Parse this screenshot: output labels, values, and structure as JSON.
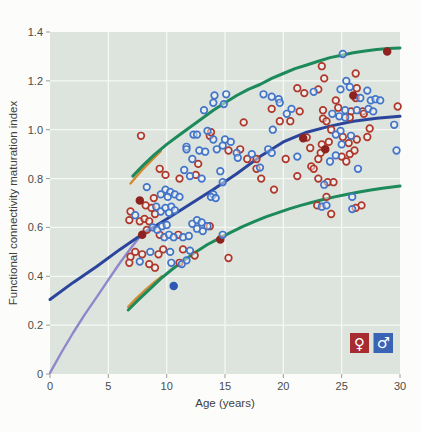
{
  "figure": {
    "xlabel": "Age (years)",
    "ylabel": "Functional connectivity maturation index",
    "legend": {
      "female_symbol": "♀",
      "male_symbol": "♂",
      "female_color": "#a82b31",
      "male_color": "#3a62b5"
    }
  },
  "chart_data": {
    "type": "scatter",
    "title": "",
    "xlabel": "Age (years)",
    "ylabel": "Functional connectivity maturation index",
    "xlim": [
      0,
      30
    ],
    "ylim": [
      0,
      1.4
    ],
    "xticks": [
      "0",
      "5",
      "10",
      "15",
      "20",
      "25",
      "30"
    ],
    "xtick_values": [
      0,
      5,
      10,
      15,
      20,
      25,
      30
    ],
    "yticks": [
      "0",
      "0.2",
      "0.4",
      "0.6",
      "0.8",
      "1.0",
      "1.2",
      "1.4"
    ],
    "ytick_values": [
      0,
      0.2,
      0.4,
      0.6,
      0.8,
      1.0,
      1.2,
      1.4
    ],
    "grid": true,
    "plot_bg": "#dde4de",
    "grid_color": "#f4f7f4",
    "legend_position": "bottom-right-inside",
    "series": [
      {
        "name": "female",
        "legend_symbol": "♀",
        "marker": "open-circle",
        "color": "#b0372b",
        "filled_color": "#8e2320",
        "points": [
          [
            7.8,
            0.975
          ],
          [
            9.4,
            0.84
          ],
          [
            9.9,
            0.815
          ],
          [
            11.1,
            0.8
          ],
          [
            12.5,
            0.815
          ],
          [
            12.7,
            0.86
          ],
          [
            13.7,
            0.975
          ],
          [
            13.8,
            0.99
          ],
          [
            16.6,
            1.03
          ],
          [
            16.3,
            0.92
          ],
          [
            15.3,
            0.915
          ],
          [
            16.9,
            0.88
          ],
          [
            17.7,
            0.88
          ],
          [
            19.0,
            1.085
          ],
          [
            19.7,
            1.035
          ],
          [
            20.6,
            1.035
          ],
          [
            21.2,
            1.17
          ],
          [
            21.8,
            1.15
          ],
          [
            21.4,
            1.075
          ],
          [
            22.0,
            0.968
          ],
          [
            22.3,
            0.925
          ],
          [
            20.2,
            0.88
          ],
          [
            23.3,
            1.26
          ],
          [
            23.5,
            1.21
          ],
          [
            26.2,
            1.23
          ],
          [
            23.0,
            1.165
          ],
          [
            26.3,
            1.17
          ],
          [
            24.5,
            1.12
          ],
          [
            24.7,
            1.09
          ],
          [
            25.8,
            1.075
          ],
          [
            26.8,
            1.075
          ],
          [
            23.4,
            1.08
          ],
          [
            23.4,
            1.045
          ],
          [
            23.7,
            1.035
          ],
          [
            25.7,
            1.05
          ],
          [
            26.9,
            1.065
          ],
          [
            29.8,
            1.095
          ],
          [
            27.4,
            1.005
          ],
          [
            24.1,
            1.0
          ],
          [
            25.1,
            0.97
          ],
          [
            26.3,
            0.96
          ],
          [
            25.6,
            0.945
          ],
          [
            23.9,
            0.95
          ],
          [
            23.3,
            0.94
          ],
          [
            23.2,
            0.905
          ],
          [
            25.0,
            0.89
          ],
          [
            25.7,
            0.9
          ],
          [
            26.1,
            0.915
          ],
          [
            23.0,
            0.88
          ],
          [
            25.4,
            0.87
          ],
          [
            27.2,
            0.97
          ],
          [
            26.2,
            1.13
          ],
          [
            22.4,
            0.85
          ],
          [
            22.6,
            0.84
          ],
          [
            23.0,
            0.8
          ],
          [
            23.8,
            0.785
          ],
          [
            24.3,
            0.785
          ],
          [
            23.7,
            0.725
          ],
          [
            22.9,
            0.69
          ],
          [
            24.1,
            0.655
          ],
          [
            26.7,
            0.69
          ],
          [
            26.2,
            0.68
          ],
          [
            17.7,
            0.84
          ],
          [
            18.1,
            0.8
          ],
          [
            19.2,
            0.755
          ],
          [
            21.2,
            0.81
          ],
          [
            13.7,
            0.605
          ],
          [
            15.3,
            0.475
          ],
          [
            8.9,
            0.72
          ],
          [
            8.2,
            0.69
          ],
          [
            8.7,
            0.68
          ],
          [
            9.0,
            0.655
          ],
          [
            6.9,
            0.665
          ],
          [
            6.8,
            0.63
          ],
          [
            7.7,
            0.625
          ],
          [
            8.1,
            0.635
          ],
          [
            8.5,
            0.625
          ],
          [
            8.3,
            0.59
          ],
          [
            9.4,
            0.57
          ],
          [
            11.0,
            0.57
          ],
          [
            11.4,
            0.51
          ],
          [
            12.4,
            0.485
          ],
          [
            11.1,
            0.455
          ],
          [
            9.7,
            0.51
          ],
          [
            9.3,
            0.49
          ],
          [
            7.9,
            0.49
          ],
          [
            7.3,
            0.5
          ],
          [
            6.9,
            0.48
          ],
          [
            8.5,
            0.45
          ],
          [
            9.0,
            0.435
          ],
          [
            6.8,
            0.455
          ]
        ],
        "filled_points": [
          [
            21.7,
            0.965
          ],
          [
            23.6,
            0.92
          ],
          [
            26.0,
            1.14
          ],
          [
            28.9,
            1.32
          ],
          [
            14.6,
            0.55
          ],
          [
            7.7,
            0.71
          ],
          [
            7.9,
            0.57
          ]
        ]
      },
      {
        "name": "male",
        "legend_symbol": "♂",
        "marker": "open-circle",
        "color": "#4274c9",
        "filled_color": "#2f58b5",
        "points": [
          [
            13.2,
            1.08
          ],
          [
            12.3,
            0.98
          ],
          [
            11.7,
            0.93
          ],
          [
            12.8,
            0.915
          ],
          [
            12.6,
            0.98
          ],
          [
            13.5,
            0.995
          ],
          [
            11.7,
            0.92
          ],
          [
            12.2,
            0.88
          ],
          [
            13.3,
            0.91
          ],
          [
            14.1,
            1.14
          ],
          [
            15.1,
            1.145
          ],
          [
            14.9,
            1.105
          ],
          [
            14.0,
            1.11
          ],
          [
            18.3,
            1.145
          ],
          [
            19.0,
            1.135
          ],
          [
            19.6,
            1.125
          ],
          [
            19.7,
            1.11
          ],
          [
            20.7,
            1.085
          ],
          [
            20.3,
            1.065
          ],
          [
            19.1,
            1.0
          ],
          [
            15.0,
            0.96
          ],
          [
            14.8,
            0.935
          ],
          [
            14.3,
            0.92
          ],
          [
            15.5,
            0.95
          ],
          [
            16.0,
            0.905
          ],
          [
            16.1,
            0.885
          ],
          [
            17.3,
            0.9
          ],
          [
            14.0,
            0.96
          ],
          [
            18.7,
            0.92
          ],
          [
            19.0,
            0.905
          ],
          [
            21.2,
            0.89
          ],
          [
            25.4,
            1.2
          ],
          [
            22.6,
            1.155
          ],
          [
            24.9,
            1.165
          ],
          [
            25.7,
            1.175
          ],
          [
            27.2,
            1.16
          ],
          [
            26.6,
            1.13
          ],
          [
            27.5,
            1.12
          ],
          [
            27.9,
            1.125
          ],
          [
            28.3,
            1.12
          ],
          [
            25.3,
            1.08
          ],
          [
            26.3,
            1.08
          ],
          [
            27.3,
            1.085
          ],
          [
            27.7,
            1.075
          ],
          [
            24.2,
            1.065
          ],
          [
            24.8,
            1.055
          ],
          [
            25.3,
            1.05
          ],
          [
            29.5,
            1.02
          ],
          [
            24.9,
            0.995
          ],
          [
            24.5,
            0.98
          ],
          [
            25.8,
            0.975
          ],
          [
            25.0,
            0.94
          ],
          [
            24.5,
            0.895
          ],
          [
            24.0,
            0.87
          ],
          [
            29.7,
            0.915
          ],
          [
            25.1,
            1.31
          ],
          [
            26.4,
            0.84
          ],
          [
            23.5,
            0.775
          ],
          [
            25.9,
            0.725
          ],
          [
            23.3,
            0.685
          ],
          [
            23.7,
            0.69
          ],
          [
            25.9,
            0.675
          ],
          [
            14.6,
            0.83
          ],
          [
            14.8,
            0.785
          ],
          [
            14.0,
            0.735
          ],
          [
            13.8,
            0.725
          ],
          [
            14.2,
            0.72
          ],
          [
            18.0,
            0.845
          ],
          [
            14.8,
            0.57
          ],
          [
            11.5,
            0.835
          ],
          [
            12.0,
            0.81
          ],
          [
            13.0,
            0.8
          ],
          [
            8.3,
            0.765
          ],
          [
            9.5,
            0.735
          ],
          [
            9.9,
            0.755
          ],
          [
            10.3,
            0.745
          ],
          [
            10.1,
            0.725
          ],
          [
            10.7,
            0.735
          ],
          [
            11.1,
            0.725
          ],
          [
            9.1,
            0.685
          ],
          [
            9.5,
            0.665
          ],
          [
            9.9,
            0.68
          ],
          [
            10.4,
            0.685
          ],
          [
            10.2,
            0.66
          ],
          [
            10.7,
            0.67
          ],
          [
            7.3,
            0.65
          ],
          [
            8.8,
            0.6
          ],
          [
            9.2,
            0.59
          ],
          [
            9.6,
            0.605
          ],
          [
            10.0,
            0.61
          ],
          [
            9.8,
            0.56
          ],
          [
            10.2,
            0.57
          ],
          [
            10.6,
            0.56
          ],
          [
            11.4,
            0.56
          ],
          [
            11.9,
            0.565
          ],
          [
            12.2,
            0.615
          ],
          [
            12.6,
            0.63
          ],
          [
            13.0,
            0.62
          ],
          [
            12.6,
            0.595
          ],
          [
            13.1,
            0.585
          ],
          [
            13.5,
            0.605
          ],
          [
            12.0,
            0.505
          ],
          [
            11.7,
            0.465
          ],
          [
            10.3,
            0.5
          ],
          [
            8.6,
            0.5
          ],
          [
            7.7,
            0.46
          ],
          [
            11.3,
            0.45
          ],
          [
            10.4,
            0.455
          ]
        ],
        "filled_points": [
          [
            10.6,
            0.36
          ]
        ]
      }
    ],
    "curves": [
      {
        "name": "alt-fit-curve",
        "color": "#8f87c9",
        "width": 2.4,
        "points": [
          [
            0,
            0.005
          ],
          [
            1,
            0.09
          ],
          [
            2,
            0.17
          ],
          [
            3,
            0.245
          ],
          [
            4,
            0.315
          ],
          [
            5,
            0.385
          ],
          [
            6,
            0.455
          ],
          [
            7,
            0.52
          ],
          [
            7.8,
            0.568
          ],
          [
            8.6,
            0.6
          ]
        ]
      },
      {
        "name": "orange-upper-segment",
        "color": "#d18a32",
        "width": 2.4,
        "points": [
          [
            6.9,
            0.78
          ],
          [
            7.8,
            0.83
          ],
          [
            8.7,
            0.875
          ],
          [
            9.5,
            0.912
          ]
        ]
      },
      {
        "name": "orange-lower-segment",
        "color": "#d18a32",
        "width": 2.4,
        "points": [
          [
            6.7,
            0.275
          ],
          [
            7.4,
            0.31
          ],
          [
            8.2,
            0.345
          ],
          [
            9.0,
            0.378
          ],
          [
            9.6,
            0.4
          ]
        ]
      },
      {
        "name": "upper-bound-curve",
        "color": "#1c8a5a",
        "width": 3,
        "points": [
          [
            7.1,
            0.81
          ],
          [
            8,
            0.855
          ],
          [
            9,
            0.9
          ],
          [
            10,
            0.94
          ],
          [
            11,
            0.975
          ],
          [
            12,
            1.01
          ],
          [
            13,
            1.045
          ],
          [
            14,
            1.08
          ],
          [
            15,
            1.11
          ],
          [
            16,
            1.14
          ],
          [
            17,
            1.165
          ],
          [
            18,
            1.185
          ],
          [
            19,
            1.21
          ],
          [
            20,
            1.23
          ],
          [
            21,
            1.25
          ],
          [
            22,
            1.265
          ],
          [
            23,
            1.28
          ],
          [
            24,
            1.295
          ],
          [
            25,
            1.305
          ],
          [
            26,
            1.315
          ],
          [
            27,
            1.322
          ],
          [
            28,
            1.328
          ],
          [
            29,
            1.332
          ],
          [
            30,
            1.335
          ]
        ]
      },
      {
        "name": "lower-bound-curve",
        "color": "#1c8a5a",
        "width": 3,
        "points": [
          [
            6.7,
            0.262
          ],
          [
            7.5,
            0.3
          ],
          [
            8.5,
            0.345
          ],
          [
            9.5,
            0.39
          ],
          [
            10.5,
            0.43
          ],
          [
            11.5,
            0.465
          ],
          [
            12.5,
            0.5
          ],
          [
            13.5,
            0.53
          ],
          [
            14.5,
            0.555
          ],
          [
            15.5,
            0.58
          ],
          [
            16.5,
            0.603
          ],
          [
            17.5,
            0.624
          ],
          [
            18.5,
            0.643
          ],
          [
            19.5,
            0.66
          ],
          [
            20.5,
            0.676
          ],
          [
            21.5,
            0.69
          ],
          [
            22.5,
            0.703
          ],
          [
            23.5,
            0.715
          ],
          [
            24.5,
            0.726
          ],
          [
            25.5,
            0.736
          ],
          [
            26.5,
            0.745
          ],
          [
            27.5,
            0.753
          ],
          [
            28.5,
            0.76
          ],
          [
            30,
            0.769
          ]
        ]
      },
      {
        "name": "fit-curve",
        "color": "#2c459c",
        "width": 3,
        "points": [
          [
            0,
            0.305
          ],
          [
            2,
            0.375
          ],
          [
            4,
            0.44
          ],
          [
            6,
            0.51
          ],
          [
            8,
            0.575
          ],
          [
            10,
            0.635
          ],
          [
            12,
            0.695
          ],
          [
            14,
            0.755
          ],
          [
            16,
            0.82
          ],
          [
            18,
            0.89
          ],
          [
            20,
            0.95
          ],
          [
            22,
            0.99
          ],
          [
            24,
            1.015
          ],
          [
            26,
            1.035
          ],
          [
            28,
            1.047
          ],
          [
            30,
            1.055
          ]
        ]
      }
    ]
  }
}
